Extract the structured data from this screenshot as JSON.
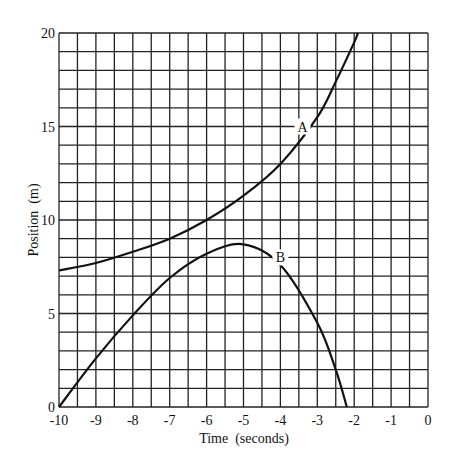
{
  "chart_data": {
    "type": "line",
    "title": "",
    "xlabel": "Time  (seconds)",
    "ylabel": "Position  (m)",
    "xlim": [
      -10,
      0
    ],
    "ylim": [
      0,
      20
    ],
    "grid": true,
    "grid_x_step": 0.5,
    "grid_y_step": 1,
    "x_ticks": [
      "-10",
      "-9",
      "-8",
      "-7",
      "-6",
      "-5",
      "-4",
      "-3",
      "-2",
      "-1",
      "0"
    ],
    "y_ticks": [
      "0",
      "5",
      "10",
      "15",
      "20"
    ],
    "legend": "none (curves labeled inline)",
    "series": [
      {
        "name": "A",
        "x": [
          -10,
          -9,
          -8,
          -7,
          -6,
          -5,
          -4,
          -3,
          -2.5,
          -2,
          -1.9
        ],
        "values": [
          7.3,
          7.7,
          8.3,
          9.0,
          10.0,
          11.3,
          13.0,
          15.5,
          17.4,
          19.5,
          20.0
        ]
      },
      {
        "name": "B",
        "x": [
          -10,
          -9,
          -8,
          -7,
          -6,
          -5,
          -4,
          -3,
          -2.5,
          -2.2
        ],
        "values": [
          0,
          2.6,
          4.9,
          6.9,
          8.2,
          8.7,
          7.6,
          4.5,
          2.0,
          0
        ]
      }
    ],
    "annotations": [
      {
        "text": "A",
        "x": -3.4,
        "y": 15
      },
      {
        "text": "B",
        "x": -4.0,
        "y": 8
      }
    ]
  }
}
